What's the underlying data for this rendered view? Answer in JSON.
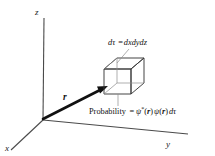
{
  "figure": {
    "background_color": "#ffffff",
    "line_color": "#3a3a3a",
    "vector_color": "#111111",
    "text_color": "#111111"
  },
  "axes": {
    "x_label": "x",
    "y_label": "y",
    "z_label": "z",
    "origin": "O"
  },
  "vector": {
    "label": "r",
    "description": "position vector from origin to volume element"
  },
  "cube": {
    "name": "volume-element",
    "label": "dτ"
  },
  "annotations": {
    "volume": {
      "prefix": "d",
      "tau": "τ",
      "equals": "=",
      "expression": "dxdydz",
      "full": "dτ = dxdydz"
    },
    "probability": {
      "word": "Probability",
      "equals": "=",
      "psi_star": "ψ",
      "star": "*",
      "open1": "(",
      "r1": "r",
      "close1": ")",
      "psi": "ψ",
      "open2": "(",
      "r2": "r",
      "close2": ")",
      "dtau": "dτ",
      "full": "Probability = ψ*(r)ψ(r)dτ"
    }
  }
}
